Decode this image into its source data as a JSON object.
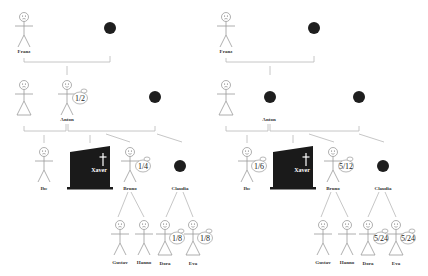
{
  "diagram": {
    "type": "family-tree-inheritance",
    "panels": [
      {
        "id": "left",
        "persons": {
          "franz": {
            "name": "Franz",
            "kind": "male",
            "share": ""
          },
          "franz_spouse": {
            "name": "",
            "kind": "deceased-dot",
            "share": ""
          },
          "anton_spouse": {
            "name": "",
            "kind": "female",
            "share": ""
          },
          "anton": {
            "name": "Anton",
            "kind": "male-heir",
            "share": "1/2"
          },
          "anton_partner2": {
            "name": "",
            "kind": "deceased-dot",
            "share": ""
          },
          "ibe": {
            "name": "Ibe",
            "kind": "male",
            "share": ""
          },
          "xaver": {
            "name": "Xaver",
            "kind": "tombstone",
            "share": ""
          },
          "bruno": {
            "name": "Bruno",
            "kind": "male-heir",
            "share": "1/4"
          },
          "claudia": {
            "name": "Claudia",
            "kind": "deceased-dot",
            "share": ""
          },
          "gustav": {
            "name": "Gustav",
            "kind": "male",
            "share": ""
          },
          "hanno": {
            "name": "Hanno",
            "kind": "male",
            "share": ""
          },
          "dora": {
            "name": "Dora",
            "kind": "female-heir",
            "share": "1/8"
          },
          "eva": {
            "name": "Eva",
            "kind": "female-heir",
            "share": "1/8"
          }
        }
      },
      {
        "id": "right",
        "persons": {
          "franz": {
            "name": "Franz",
            "kind": "male",
            "share": ""
          },
          "franz_spouse": {
            "name": "",
            "kind": "deceased-dot",
            "share": ""
          },
          "anton_spouse": {
            "name": "",
            "kind": "female",
            "share": ""
          },
          "anton": {
            "name": "Anton",
            "kind": "deceased-dot",
            "share": ""
          },
          "anton_partner2": {
            "name": "",
            "kind": "deceased-dot",
            "share": ""
          },
          "ibe": {
            "name": "Ibe",
            "kind": "male-heir",
            "share": "1/6"
          },
          "xaver": {
            "name": "Xaver",
            "kind": "tombstone",
            "share": ""
          },
          "bruno": {
            "name": "Bruno",
            "kind": "male-heir",
            "share": "5/12"
          },
          "claudia": {
            "name": "Claudia",
            "kind": "deceased-dot",
            "share": ""
          },
          "gustav": {
            "name": "Gustav",
            "kind": "male",
            "share": ""
          },
          "hanno": {
            "name": "Hanno",
            "kind": "male",
            "share": ""
          },
          "dora": {
            "name": "Dora",
            "kind": "female-heir",
            "share": "5/24"
          },
          "eva": {
            "name": "Eva",
            "kind": "female-heir",
            "share": "5/24"
          }
        }
      }
    ]
  },
  "colors": {
    "background": "#ffffff",
    "lines": "#b8b8b8",
    "figure": "#9a9a9a",
    "deceased": "#1e1e1e"
  }
}
